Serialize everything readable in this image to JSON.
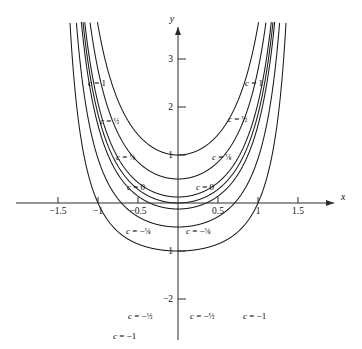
{
  "figure": {
    "kind": "level-curve-plot",
    "background_color": "#ffffff",
    "curve_color": "#1a1a1a",
    "axis_color": "#2b2b2b"
  },
  "axes": {
    "x_axis_name": "x",
    "y_axis_name": "y",
    "x_ticks": [
      {
        "value": -1.5,
        "label": "−1.5"
      },
      {
        "value": -1.0,
        "label": "−1"
      },
      {
        "value": -0.5,
        "label": "−0.5"
      },
      {
        "value": 0.5,
        "label": "0.5"
      },
      {
        "value": 1.0,
        "label": "1"
      },
      {
        "value": 1.5,
        "label": "1.5"
      }
    ],
    "y_ticks": [
      {
        "value": 3,
        "label": "3"
      },
      {
        "value": 2,
        "label": "2"
      },
      {
        "value": 1,
        "label": "1"
      },
      {
        "value": -1,
        "label": "−1"
      },
      {
        "value": -2,
        "label": "−2"
      }
    ],
    "x_range": [
      -1.72,
      1.72
    ],
    "y_range": [
      -2.45,
      3.75
    ],
    "origin_px": {
      "x": 178,
      "y": 203
    },
    "px_per_unit": {
      "x": 80,
      "y": 48
    },
    "grid": false
  },
  "chart_data": {
    "type": "line",
    "title": "",
    "xlabel": "x",
    "ylabel": "y",
    "xlim": [
      -1.72,
      1.72
    ],
    "ylim": [
      -2.45,
      3.75
    ],
    "grid": false,
    "legend": "inline-curve-labels",
    "series": [
      {
        "name": "c = 1",
        "c": 1,
        "label": "c = 1"
      },
      {
        "name": "c = 1/2",
        "c": 0.5,
        "label": "c = ½"
      },
      {
        "name": "c = 1/8",
        "c": 0.125,
        "label": "c = ⅛"
      },
      {
        "name": "c = 0",
        "c": 0,
        "label": "c = 0"
      },
      {
        "name": "c = -1/8",
        "c": -0.125,
        "label": "c = −⅛"
      },
      {
        "name": "c = -1/2",
        "c": -0.5,
        "label": "c = −½"
      },
      {
        "name": "c = -1",
        "c": -1,
        "label": "c = −1"
      }
    ]
  },
  "curve_labels": [
    {
      "id": "left-c-1",
      "c_text": "c",
      "eq": "=",
      "value": "1",
      "frac": "",
      "x": 88,
      "y": 78
    },
    {
      "id": "left-c-half",
      "c_text": "c",
      "eq": "=",
      "value": "",
      "frac": "½",
      "x": 100,
      "y": 116
    },
    {
      "id": "left-c-eighth",
      "c_text": "c",
      "eq": "=",
      "value": "",
      "frac": "⅛",
      "x": 116,
      "y": 152
    },
    {
      "id": "left-c-zero",
      "c_text": "c",
      "eq": "=",
      "value": "0",
      "frac": "",
      "x": 127,
      "y": 182
    },
    {
      "id": "right-c-zero",
      "c_text": "c",
      "eq": "=",
      "value": "0",
      "frac": "",
      "x": 196,
      "y": 182
    },
    {
      "id": "right-c-eighth",
      "c_text": "c",
      "eq": "=",
      "value": "",
      "frac": "⅛",
      "x": 212,
      "y": 152
    },
    {
      "id": "right-c-half",
      "c_text": "c",
      "eq": "=",
      "value": "",
      "frac": "½",
      "x": 228,
      "y": 114
    },
    {
      "id": "right-c-1",
      "c_text": "c",
      "eq": "=",
      "value": "1",
      "frac": "",
      "x": 245,
      "y": 78
    },
    {
      "id": "left-c-neg-eighth",
      "c_text": "c",
      "eq": "=",
      "value": "−",
      "frac": "⅛",
      "x": 126,
      "y": 226
    },
    {
      "id": "right-c-neg-eighth",
      "c_text": "c",
      "eq": "=",
      "value": "−",
      "frac": "⅛",
      "x": 186,
      "y": 226
    },
    {
      "id": "left-c-neg-half",
      "c_text": "c",
      "eq": "=",
      "value": "−",
      "frac": "½",
      "x": 128,
      "y": 311
    },
    {
      "id": "right-c-neg-half",
      "c_text": "c",
      "eq": "=",
      "value": "−",
      "frac": "½",
      "x": 190,
      "y": 311
    },
    {
      "id": "left-c-neg-1",
      "c_text": "c",
      "eq": "=",
      "value": "−1",
      "frac": "",
      "x": 113,
      "y": 331
    },
    {
      "id": "right-c-neg-1",
      "c_text": "c",
      "eq": "=",
      "value": "−1",
      "frac": "",
      "x": 243,
      "y": 311
    }
  ]
}
